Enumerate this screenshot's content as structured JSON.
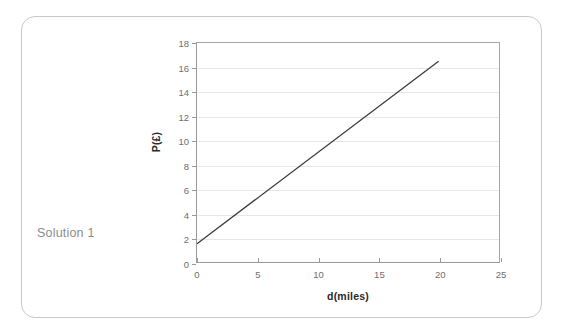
{
  "caption": {
    "text": "Solution 1"
  },
  "chart_data": {
    "type": "line",
    "title": "",
    "xlabel": "d(miles)",
    "ylabel": "P(£)",
    "xlim": [
      0,
      25
    ],
    "ylim": [
      0,
      18
    ],
    "xticks": [
      "0",
      "5",
      "10",
      "15",
      "20",
      "25"
    ],
    "xtick_values": [
      0,
      5,
      10,
      15,
      20,
      25
    ],
    "yticks": [
      "0",
      "2",
      "4",
      "6",
      "8",
      "10",
      "12",
      "14",
      "16",
      "18"
    ],
    "ytick_values": [
      0,
      2,
      4,
      6,
      8,
      10,
      12,
      14,
      16,
      18
    ],
    "grid": "horizontal",
    "legend": "none",
    "series": [
      {
        "name": "P against d",
        "x": [
          0,
          20
        ],
        "values": [
          1.5,
          16.5
        ],
        "color": "#3a3a3a"
      }
    ]
  },
  "colors": {
    "card_border": "#c9c9c9",
    "axis": "#9a9a9a",
    "gridline": "#e6e6e6",
    "tick_label": "#6e6e6e",
    "axis_title": "#2a2a2a",
    "caption": "#8c8c8c",
    "line": "#3a3a3a",
    "background": "#ffffff"
  }
}
